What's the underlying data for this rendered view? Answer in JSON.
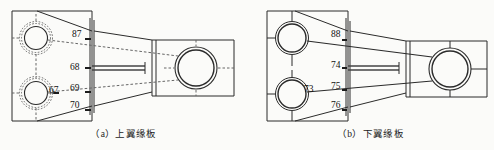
{
  "figure": {
    "type": "engineering-drawing"
  },
  "panels": [
    {
      "id": "a",
      "caption": "（a）上翼缘板",
      "labels": [
        {
          "text": "87",
          "x": 72,
          "y": 30
        },
        {
          "text": "68",
          "x": 70,
          "y": 63
        },
        {
          "text": "69",
          "x": 70,
          "y": 84
        },
        {
          "text": "70",
          "x": 70,
          "y": 101
        },
        {
          "text": "67",
          "x": 49,
          "y": 86
        }
      ]
    },
    {
      "id": "b",
      "caption": "（b）下翼缘板",
      "labels": [
        {
          "text": "88",
          "x": 84,
          "y": 30
        },
        {
          "text": "74",
          "x": 84,
          "y": 61
        },
        {
          "text": "75",
          "x": 84,
          "y": 82
        },
        {
          "text": "76",
          "x": 84,
          "y": 101
        },
        {
          "text": "73",
          "x": 57,
          "y": 85
        }
      ]
    }
  ],
  "colors": {
    "background": "#fbfbf9",
    "line": "#2b2b2b",
    "line_light": "#555555",
    "text": "#111111"
  }
}
